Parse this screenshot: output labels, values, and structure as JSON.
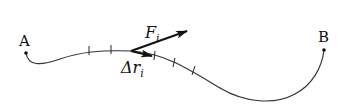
{
  "diagram": {
    "points": {
      "start": {
        "label": "A"
      },
      "end": {
        "label": "B"
      }
    },
    "vectors": {
      "force": {
        "symbol": "F",
        "subscript": "i"
      },
      "displacement": {
        "symbol": "Δr",
        "subscript": "i"
      }
    },
    "colors": {
      "stroke": "#111111",
      "background": "#ffffff"
    }
  }
}
